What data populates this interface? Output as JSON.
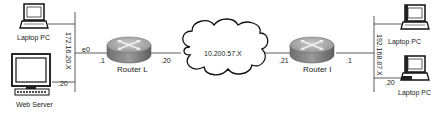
{
  "diagram": {
    "cloud": {
      "label": "10.200.57.X"
    },
    "routers": [
      {
        "name": "Router L",
        "interfaces": {
          "lan_ip": ".1",
          "lan_port": "e0",
          "wan_ip": ".20"
        }
      },
      {
        "name": "Router I",
        "interfaces": {
          "wan_ip": ".21",
          "lan_ip": ".1"
        }
      }
    ],
    "left_lan": {
      "subnet": "172.16.20.X",
      "hosts": [
        {
          "name": "Laptop PC",
          "ip": ""
        },
        {
          "name": "Web Server",
          "ip": ".20"
        }
      ]
    },
    "right_lan": {
      "subnet": "192.168.87.X",
      "hosts": [
        {
          "name": "Laptop PC",
          "ip": ""
        },
        {
          "name": "Laptop PC",
          "ip": ".20"
        }
      ]
    }
  }
}
